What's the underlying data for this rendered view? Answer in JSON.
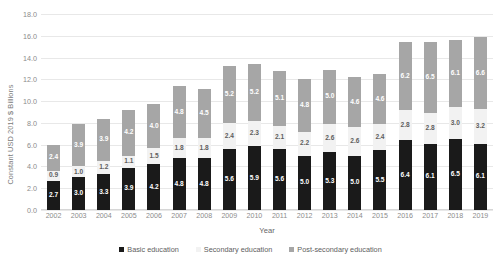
{
  "chart_data": {
    "type": "bar",
    "stacked": true,
    "title": "",
    "xlabel": "Year",
    "ylabel": "Constant USD 2019 $ Billions",
    "ylim": [
      0.0,
      18.0
    ],
    "ytick_step": 2.0,
    "ytick_labels": [
      "18.0",
      "16.0",
      "14.0",
      "12.0",
      "10.0",
      "8.0",
      "6.0",
      "4.0",
      "2.0",
      "0.0"
    ],
    "grid": true,
    "legend_position": "bottom",
    "categories": [
      "2002",
      "2003",
      "2004",
      "2005",
      "2006",
      "2007",
      "2008",
      "2009",
      "2010",
      "2011",
      "2012",
      "2013",
      "2014",
      "2015",
      "2016",
      "2017",
      "2018",
      "2019"
    ],
    "series": [
      {
        "name": "Basic education",
        "color": "#1a1a1a",
        "values": [
          2.7,
          3.0,
          3.3,
          3.9,
          4.2,
          4.8,
          4.8,
          5.6,
          5.9,
          5.6,
          5.0,
          5.3,
          5.0,
          5.5,
          6.4,
          6.1,
          6.5,
          6.1
        ],
        "labels": [
          "2.7",
          "3.0",
          "3.3",
          "3.9",
          "4.2",
          "4.8",
          "4.8",
          "5.6",
          "5.9",
          "5.6",
          "5.0",
          "5.3",
          "5.0",
          "5.5",
          "6.4",
          "6.1",
          "6.5",
          "6.1"
        ]
      },
      {
        "name": "Secondary education",
        "color": "#f2f2f2",
        "values": [
          0.9,
          1.0,
          1.2,
          1.1,
          1.5,
          1.8,
          1.8,
          2.4,
          2.3,
          2.1,
          2.2,
          2.6,
          2.6,
          2.4,
          2.8,
          2.8,
          3.0,
          3.2
        ],
        "labels": [
          "0.9",
          "1.0",
          "1.2",
          "1.1",
          "1.5",
          "1.8",
          "1.8",
          "2.4",
          "2.3",
          "2.1",
          "2.2",
          "2.6",
          "2.6",
          "2.4",
          "2.8",
          "2.8",
          "3.0",
          "3.2"
        ]
      },
      {
        "name": "Post-secondary education",
        "color": "#a6a6a6",
        "values": [
          2.4,
          3.9,
          3.9,
          4.2,
          4.0,
          4.8,
          4.5,
          5.2,
          5.2,
          5.1,
          4.8,
          5.0,
          4.6,
          4.6,
          6.2,
          6.5,
          6.1,
          6.6
        ],
        "labels": [
          "2.4",
          "3.9",
          "3.9",
          "4.2",
          "4.0",
          "4.8",
          "4.5",
          "5.2",
          "5.2",
          "5.1",
          "4.8",
          "5.0",
          "4.6",
          "4.6",
          "6.2",
          "6.5",
          "6.1",
          "6.6"
        ]
      }
    ]
  }
}
